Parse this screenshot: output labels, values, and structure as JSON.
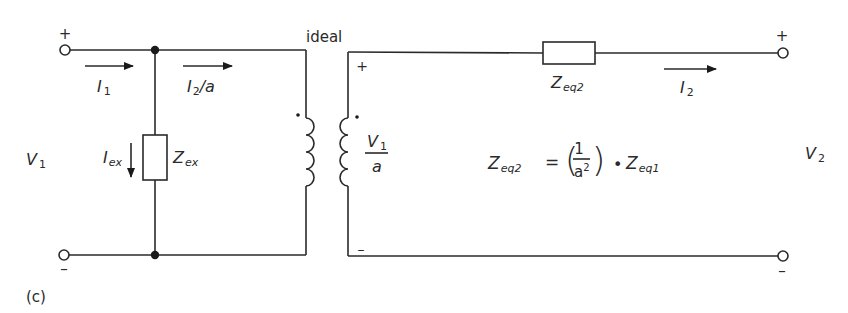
{
  "figure": {
    "label": "(c)",
    "ideal_label": "ideal",
    "colors": {
      "ink": "#2a2a2a",
      "background": "#ffffff"
    }
  },
  "primary": {
    "plus": "+",
    "minus": "–",
    "voltage": {
      "main": "V",
      "sub": "1"
    },
    "current_in": {
      "main": "I",
      "sub": "1"
    },
    "current_through": {
      "main": "I",
      "sub": "2",
      "suffix": "/a"
    },
    "excitation_current": {
      "main": "I",
      "sub": "ex"
    },
    "excitation_impedance": {
      "main": "Z",
      "sub": "ex"
    }
  },
  "transformer": {
    "secondary_plus": "+",
    "secondary_minus": "–",
    "ratio_numerator": {
      "main": "V",
      "sub": "1"
    },
    "ratio_denominator": "a"
  },
  "secondary": {
    "plus": "+",
    "minus": "–",
    "voltage": {
      "main": "V",
      "sub": "2"
    },
    "current": {
      "main": "I",
      "sub": "2"
    },
    "series_impedance": {
      "main": "Z",
      "sub": "eq2"
    }
  },
  "equation": {
    "lhs": {
      "main": "Z",
      "sub": "eq2"
    },
    "equals": "=",
    "numerator": "1",
    "denominator": {
      "main": "a",
      "sup": "2"
    },
    "operator": "•",
    "rhs": {
      "main": "Z",
      "sub": "eq1"
    }
  }
}
